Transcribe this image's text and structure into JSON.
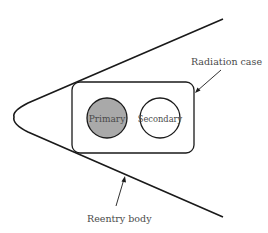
{
  "diagram": {
    "title": "",
    "labels": {
      "radiation_case": "Radiation case",
      "reentry_body": "Reentry body",
      "primary": "Primary",
      "secondary": "Secondary"
    },
    "colors": {
      "stroke": "#1a1a1a",
      "primary_fill": "#a9a9a9",
      "secondary_fill": "#ffffff",
      "text": "#4a4a4a"
    }
  }
}
